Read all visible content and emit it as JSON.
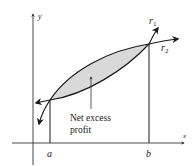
{
  "diagram": {
    "type": "area-between-curves",
    "axes": {
      "x_label": "x",
      "y_label": "y"
    },
    "points": {
      "a_label": "a",
      "b_label": "b"
    },
    "curves": {
      "upper": "r",
      "upper_sub": "1",
      "lower": "r",
      "lower_sub": "2"
    },
    "region": {
      "label_line1": "Net excess",
      "label_line2": "profit",
      "fill_color": "#d9d9d9"
    },
    "colors": {
      "stroke": "#1a1a1a",
      "axis": "#333333"
    }
  }
}
